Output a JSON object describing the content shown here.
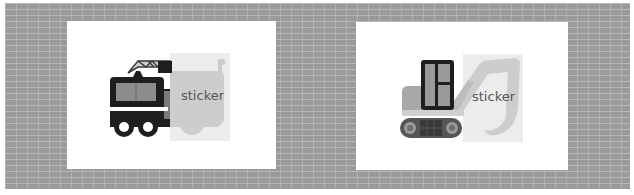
{
  "scene": {
    "background": "gray brick wall",
    "colors": {
      "brick": "#9a9a9a",
      "mortar": "#b8b8b8",
      "card": "#ffffff",
      "vehicle_dark": "#1e1e1e",
      "vehicle_mid": "#8c8c8c",
      "sticker_bg": "#e8e8e8",
      "sticker_shape": "#c8c8c8",
      "sticker_text": "#555555"
    }
  },
  "cards": [
    {
      "vehicle": "fire-truck",
      "sticker_label": "sticker"
    },
    {
      "vehicle": "excavator",
      "sticker_label": "sticker"
    }
  ]
}
